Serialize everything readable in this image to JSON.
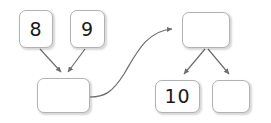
{
  "diagram": {
    "type": "binary-tree-merge-diagram",
    "background_color": "#ffffff",
    "stroke_color": "#6e6e6e",
    "box_border_color": "#b2b2b2",
    "box_fill_color": "#ffffff",
    "text_color": "#1a1a1a",
    "nodes": [
      {
        "id": "node-8",
        "label": "8",
        "x": 19,
        "y": 10,
        "w": 34,
        "h": 38
      },
      {
        "id": "node-9",
        "label": "9",
        "x": 70,
        "y": 10,
        "w": 35,
        "h": 38
      },
      {
        "id": "node-left-root",
        "label": "",
        "x": 37,
        "y": 78,
        "w": 53,
        "h": 35
      },
      {
        "id": "node-right-root",
        "label": "",
        "x": 182,
        "y": 12,
        "w": 48,
        "h": 36
      },
      {
        "id": "node-10",
        "label": "10",
        "x": 155,
        "y": 80,
        "w": 45,
        "h": 33
      },
      {
        "id": "node-empty",
        "label": "",
        "x": 212,
        "y": 80,
        "w": 38,
        "h": 33
      }
    ],
    "edges": [
      {
        "id": "edge-8-to-left-root",
        "kind": "straight-arrow",
        "from": "node-8",
        "to": "node-left-root"
      },
      {
        "id": "edge-9-to-left-root",
        "kind": "straight-arrow",
        "from": "node-9",
        "to": "node-left-root"
      },
      {
        "id": "edge-left-root-to-right-root",
        "kind": "curved-arrow",
        "from": "node-left-root",
        "to": "node-right-root"
      },
      {
        "id": "edge-right-root-to-10",
        "kind": "straight-arrow",
        "from": "node-right-root",
        "to": "node-10"
      },
      {
        "id": "edge-right-root-to-empty",
        "kind": "straight-arrow",
        "from": "node-right-root",
        "to": "node-empty"
      }
    ]
  }
}
